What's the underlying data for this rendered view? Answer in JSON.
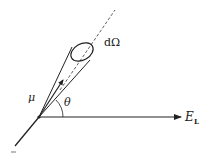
{
  "diagram": {
    "labels": {
      "solid_angle": "dΩ",
      "mu": "μ",
      "theta": "θ",
      "field": "E",
      "field_subscript": "L"
    },
    "colors": {
      "stroke": "#222222",
      "background": "#ffffff"
    }
  }
}
